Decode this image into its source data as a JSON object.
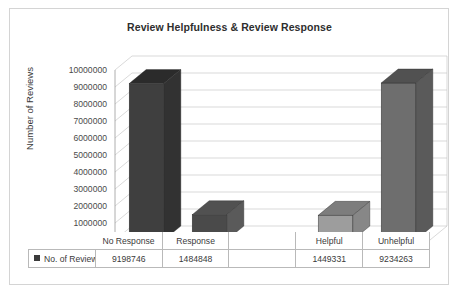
{
  "chart_data": {
    "type": "bar",
    "title": "Review Helpfulness & Review Response",
    "xlabel": "",
    "ylabel": "Number of Reviews",
    "categories": [
      "No Response",
      "Response",
      "",
      "Helpful",
      "Unhelpful"
    ],
    "values": [
      9198746,
      1484848,
      null,
      1449331,
      9234263
    ],
    "series": [
      {
        "name": "No. of Reviews",
        "values": [
          9198746,
          1484848,
          null,
          1449331,
          9234263
        ]
      }
    ],
    "ylim": [
      0,
      10000000
    ],
    "ytick_labels": [
      "10000000",
      "9000000",
      "8000000",
      "7000000",
      "6000000",
      "5000000",
      "4000000",
      "3000000",
      "2000000",
      "1000000",
      "0"
    ],
    "ytick_values": [
      10000000,
      9000000,
      8000000,
      7000000,
      6000000,
      5000000,
      4000000,
      3000000,
      2000000,
      1000000,
      0
    ],
    "grid": true,
    "legend_position": "bottom-table",
    "style": "3d-column",
    "bar_colors": [
      "#3f3f3f",
      "#4a4a4a",
      null,
      "#9d9d9d",
      "#6e6e6e"
    ],
    "data_table": {
      "row_label": "No. of Reviews",
      "cells": [
        "9198746",
        "1484848",
        "",
        "1449331",
        "9234263"
      ]
    }
  },
  "colors": {
    "frame": "#d4d4d4",
    "grid": "#c8c8c8",
    "axis": "#9a9a9a",
    "text": "#3a3a3a",
    "title": "#2e2e2e",
    "bar_dark": "#3f3f3f",
    "bar_dark_top": "#2b2b2b",
    "bar_dark_side": "#323232",
    "bar_mid": "#6e6e6e",
    "bar_mid_top": "#515151",
    "bar_mid_side": "#5a5a5a",
    "bar_light": "#9d9d9d",
    "bar_light_top": "#7d7d7d",
    "bar_light_side": "#878787",
    "legend_marker": "#3b3b3b"
  }
}
